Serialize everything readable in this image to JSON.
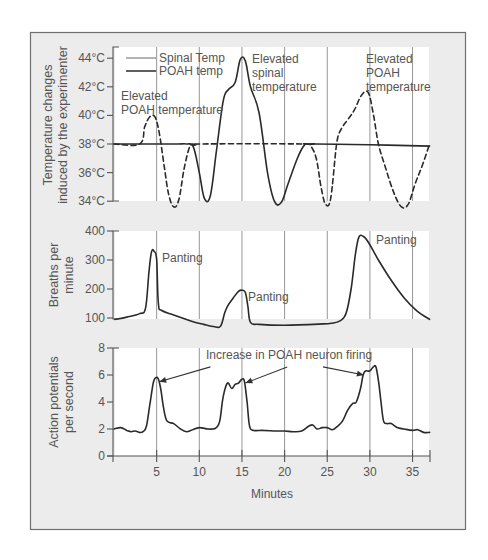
{
  "chart_data": [
    {
      "type": "line",
      "panel": "top",
      "ylabel": "Temperature changes induced by the experimenter",
      "ylabel_lines": [
        "Temperature changes",
        "induced by the experimenter"
      ],
      "yticks": [
        "34°C",
        "36°C",
        "38°C",
        "40°C",
        "42°C",
        "44°C"
      ],
      "ylim": [
        34,
        44
      ],
      "xlim": [
        0,
        37
      ],
      "legend": [
        {
          "label": "Spinal Temp",
          "style": "solid",
          "color": "#8a8a8a"
        },
        {
          "label": "POAH temp",
          "style": "solid",
          "color": "#2a2a2a"
        }
      ],
      "series": [
        {
          "name": "Spinal Temp",
          "style": "solid",
          "x": [
            0,
            5,
            7.5,
            8.5,
            9.3,
            10,
            10.6,
            11.3,
            12,
            12.8,
            13.4,
            14.2,
            14.8,
            15.4,
            16,
            17,
            18,
            18.8,
            19.6,
            20.4,
            21.5,
            22.3,
            23,
            30,
            37
          ],
          "y": [
            38,
            38,
            38,
            38,
            37.8,
            36,
            34.2,
            34.4,
            37.5,
            41,
            41.8,
            42.3,
            43.9,
            43.8,
            42,
            40.2,
            36,
            34,
            33.9,
            35.2,
            37,
            37.9,
            38,
            37.95,
            37.85
          ]
        },
        {
          "name": "POAH temp",
          "style": "dashed",
          "x": [
            0,
            3,
            3.6,
            4.2,
            4.8,
            5.3,
            5.9,
            6.4,
            7,
            7.6,
            8.2,
            8.8,
            9.2,
            9.7,
            10,
            22.3,
            23,
            23.7,
            24.3,
            24.8,
            25.4,
            26.1,
            26.6,
            27.4,
            28.2,
            29,
            29.8,
            30.4,
            31,
            31.8,
            32.8,
            33.7,
            34.5,
            35.3,
            36.2,
            37
          ],
          "y": [
            38,
            38,
            39.2,
            39.9,
            39.9,
            38.8,
            36.4,
            34.5,
            33.6,
            34.1,
            36.2,
            37.7,
            38,
            37.9,
            38,
            38,
            37.9,
            37,
            34.9,
            33.8,
            34.2,
            38,
            39,
            39.7,
            40.4,
            41.4,
            41.6,
            40.1,
            38,
            36.4,
            34.6,
            33.6,
            33.8,
            35.2,
            36.6,
            38
          ]
        }
      ],
      "annotations": [
        {
          "text": [
            "Elevated",
            "POAH temperature"
          ],
          "x_min": 0.3,
          "y_temp": 41.2
        },
        {
          "text": [
            "Elevated",
            "spinal",
            "temperature"
          ],
          "x_min": 16.3,
          "y_temp": 43.5
        },
        {
          "text": [
            "Elevated",
            "POAH",
            "temperature"
          ],
          "x_min": 26.7,
          "y_temp": 43.5
        }
      ]
    },
    {
      "type": "line",
      "panel": "middle",
      "ylabel": "Breaths per minute",
      "ylabel_lines": [
        "Breaths per",
        "minute"
      ],
      "yticks": [
        "100",
        "200",
        "300",
        "400"
      ],
      "ylim": [
        100,
        400
      ],
      "xlim": [
        0,
        37
      ],
      "series": [
        {
          "name": "Breaths per minute",
          "style": "solid",
          "x": [
            0.1,
            1.5,
            3,
            3.7,
            4.1,
            4.4,
            4.7,
            5,
            5.2,
            5.6,
            7,
            9,
            10.5,
            11.8,
            12.5,
            13,
            13.4,
            14,
            14.6,
            15,
            15.4,
            15.7,
            16,
            17,
            20,
            24,
            25.5,
            26.5,
            27.2,
            27.8,
            28.3,
            28.7,
            29.2,
            29.8,
            31,
            32.5,
            34,
            35.5,
            37
          ],
          "y": [
            95,
            103,
            115,
            135,
            260,
            328,
            330,
            300,
            150,
            126,
            110,
            90,
            78,
            70,
            72,
            120,
            145,
            170,
            192,
            196,
            188,
            140,
            85,
            78,
            75,
            79,
            82,
            90,
            115,
            200,
            320,
            378,
            382,
            362,
            300,
            230,
            170,
            125,
            95
          ]
        }
      ],
      "annotations": [
        {
          "text": "Panting",
          "x_min": 5.6,
          "y_bpm": 315
        },
        {
          "text": "Panting",
          "x_min": 16,
          "y_bpm": 175
        },
        {
          "text": "Panting",
          "x_min": 30.6,
          "y_bpm": 382
        }
      ]
    },
    {
      "type": "line",
      "panel": "bottom",
      "title": "Increase in POAH neuron firing",
      "ylabel": "Action potentials per second",
      "ylabel_lines": [
        "Action potentials",
        "per second"
      ],
      "yticks": [
        "0",
        "2",
        "4",
        "6",
        "8"
      ],
      "ylim": [
        0,
        8
      ],
      "xlabel": "Minutes",
      "xticks": [
        "5",
        "10",
        "15",
        "20",
        "25",
        "30",
        "35"
      ],
      "xlim": [
        0,
        37
      ],
      "series": [
        {
          "name": "Action potentials per second",
          "style": "solid",
          "x": [
            0,
            0.8,
            1.5,
            2,
            2.5,
            3,
            3.4,
            3.8,
            4.2,
            4.6,
            4.9,
            5.2,
            5.5,
            5.8,
            6.2,
            7,
            7.8,
            8.5,
            9.2,
            10,
            11,
            11.6,
            12,
            12.4,
            12.8,
            13.3,
            13.8,
            14.2,
            14.6,
            15,
            15.3,
            15.6,
            15.9,
            16.4,
            17.5,
            19,
            20,
            21,
            22,
            22.8,
            23.3,
            23.8,
            24.4,
            25,
            25.6,
            26.2,
            26.8,
            27.4,
            28,
            28.4,
            28.9,
            29.2,
            29.5,
            30,
            30.4,
            30.7,
            31,
            31.3,
            31.6,
            32,
            32.5,
            33.2,
            34,
            35,
            35.6,
            36.3,
            37
          ],
          "y": [
            2.0,
            2.1,
            1.9,
            1.8,
            1.85,
            1.75,
            1.8,
            2.2,
            3.8,
            5.4,
            5.8,
            5.7,
            4.9,
            3.6,
            2.6,
            2.4,
            2.0,
            1.8,
            1.95,
            2.1,
            2.0,
            2.0,
            2.1,
            2.6,
            4.4,
            5.4,
            5.0,
            5.3,
            5.4,
            5.7,
            5.5,
            4.0,
            2.2,
            1.9,
            1.9,
            1.85,
            1.85,
            1.8,
            1.85,
            2.2,
            2.3,
            2.0,
            2.1,
            2.1,
            1.95,
            2.2,
            2.6,
            3.4,
            3.9,
            4.0,
            5.0,
            6.0,
            6.3,
            6.3,
            6.6,
            6.6,
            5.6,
            4.0,
            2.6,
            2.4,
            2.4,
            2.1,
            2.0,
            1.9,
            1.95,
            1.75,
            1.75
          ]
        }
      ],
      "arrows": [
        {
          "from_min": 11.3,
          "from_y": 6.6,
          "to_min": 5.3,
          "to_y": 5.5
        },
        {
          "from_min": 20.3,
          "from_y": 6.6,
          "to_min": 15.4,
          "to_y": 5.4
        },
        {
          "from_min": 24.5,
          "from_y": 6.6,
          "to_min": 29.3,
          "to_y": 6.0
        }
      ]
    }
  ]
}
